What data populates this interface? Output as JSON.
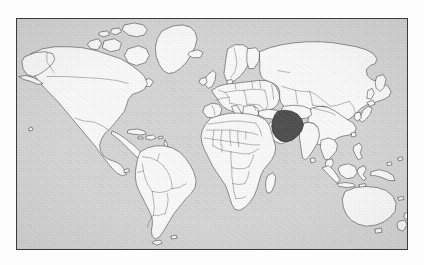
{
  "image": {
    "kind": "world-map",
    "width": 424,
    "height": 265,
    "has_text": false,
    "has_legend": false,
    "has_title": false,
    "has_axes": false,
    "alt_text": "Outline world map with Iran shaded dark"
  },
  "map": {
    "projection": "equirectangular",
    "lon_range": [
      -180,
      180
    ],
    "lat_range": [
      -58,
      84
    ],
    "frame": {
      "left": 16,
      "top": 18,
      "width": 392,
      "height": 232
    },
    "colors": {
      "page_background": "#fdfdfd",
      "ocean": "#d6d6d6",
      "land": "#fbfbfb",
      "border_line": "#4a4a4a",
      "coast_line": "#3c3c3c",
      "frame_line": "#3a3a3a",
      "highlight": "#4f4f4f",
      "highlight_outline": "#1c1c1c"
    },
    "line_weights": {
      "coastline": 0.55,
      "country_border": 0.4,
      "frame": 1
    },
    "highlighted": [
      {
        "name": "Iran",
        "fill": "#4f4f4f",
        "centroid_lon": 54,
        "centroid_lat": 32
      }
    ],
    "regions_depicted": [
      "North America",
      "South America",
      "Europe",
      "Africa",
      "Asia",
      "Oceania",
      "Greenland",
      "Antarctica excluded"
    ]
  }
}
